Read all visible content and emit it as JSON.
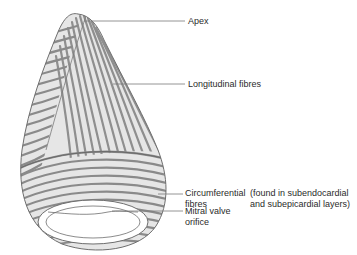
{
  "figure": {
    "colors": {
      "fibre_dark": "#8a8a8a",
      "fibre_light": "#d9d9d9",
      "outline": "#6e6e6e",
      "leader_line": "#7a7a7a",
      "text": "#2b2b2b"
    }
  },
  "labels": {
    "apex": "Apex",
    "longitudinal": "Longitudinal fibres",
    "circumferential_line1": "Circumferential",
    "circumferential_line2": "fibres",
    "note_line1": "(found in subendocardial",
    "note_line2": "and subepicardial layers)",
    "mitral_line1": "Mitral valve",
    "mitral_line2": "orifice"
  }
}
